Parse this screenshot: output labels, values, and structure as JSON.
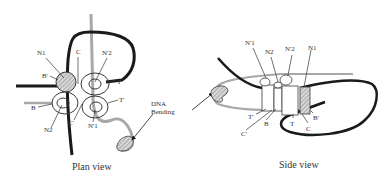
{
  "colors": {
    "dna_dark": "#1a1a1a",
    "dna_light": "#a8a8a8",
    "ring": "#3a3a3a",
    "hatch": "#9a9a9a",
    "text": "#333333"
  },
  "plan_view": {
    "caption": "Plan view",
    "labels": {
      "n1": "N1",
      "c": "C",
      "n2p": "N'2",
      "bp": "B'",
      "t": "T",
      "tp": "T'",
      "b": "B",
      "n2": "N2",
      "cp": "C'",
      "n1p": "N'1"
    },
    "annotation": {
      "line1": "DNA",
      "line2": "Bending"
    }
  },
  "side_view": {
    "caption": "Side view",
    "labels": {
      "n1p": "N'1",
      "n2": "N2",
      "n2p": "N'2",
      "n1": "N1",
      "tp": "T'",
      "b": "B",
      "cp": "C'",
      "t": "T",
      "c": "C",
      "bp": "B'"
    }
  }
}
